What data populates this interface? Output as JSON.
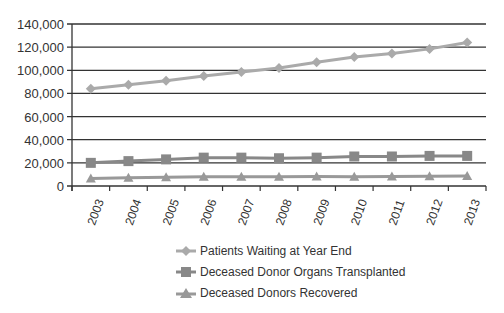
{
  "chart_data": {
    "type": "line",
    "title": "",
    "xlabel": "",
    "ylabel": "",
    "ylim": [
      0,
      140000
    ],
    "yticks": [
      0,
      20000,
      40000,
      60000,
      80000,
      100000,
      120000,
      140000
    ],
    "ytick_labels": [
      "0",
      "20,000",
      "40,000",
      "60,000",
      "80,000",
      "100,000",
      "120,000",
      "140,000"
    ],
    "grid": true,
    "legend_position": "bottom",
    "categories": [
      "2003",
      "2004",
      "2005",
      "2006",
      "2007",
      "2008",
      "2009",
      "2010",
      "2011",
      "2012",
      "2013"
    ],
    "series": [
      {
        "name": "Patients Waiting at Year End",
        "marker": "diamond",
        "color": "#aaaaaa",
        "values": [
          84000,
          87500,
          91000,
          95000,
          98500,
          102000,
          107000,
          111500,
          114500,
          118500,
          124000
        ]
      },
      {
        "name": "Deceased Donor Organs Transplanted",
        "marker": "square",
        "color": "#888888",
        "values": [
          20000,
          21500,
          23000,
          24500,
          24500,
          24000,
          24500,
          25500,
          25500,
          26000,
          26000
        ]
      },
      {
        "name": "Deceased Donors Recovered",
        "marker": "triangle",
        "color": "#999999",
        "values": [
          6500,
          7200,
          7600,
          7900,
          8000,
          8100,
          8200,
          8100,
          8300,
          8500,
          8600
        ]
      }
    ]
  },
  "legend": {
    "items": [
      {
        "label": "Patients Waiting at Year End"
      },
      {
        "label": "Deceased Donor Organs Transplanted"
      },
      {
        "label": "Deceased Donors Recovered"
      }
    ]
  }
}
